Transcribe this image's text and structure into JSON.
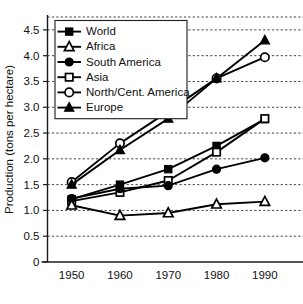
{
  "chart_data": {
    "type": "line",
    "title": "",
    "subtitle": "",
    "xlabel": "",
    "ylabel": "Production (tons per hectare)",
    "x": [
      1950,
      1960,
      1970,
      1980,
      1990
    ],
    "categories": [
      "1950",
      "1960",
      "1970",
      "1980",
      "1990"
    ],
    "xtick_labels": [
      "1950",
      "1960",
      "1970",
      "1980",
      "1990"
    ],
    "ytick_labels": [
      "0",
      "0.5",
      "1.0",
      "1.5",
      "2.0",
      "2.5",
      "3.0",
      "3.5",
      "4.0",
      "4.5"
    ],
    "ytick_values": [
      0,
      0.5,
      1.0,
      1.5,
      2.0,
      2.5,
      3.0,
      3.5,
      4.0,
      4.5
    ],
    "xlim": [
      1945,
      1995
    ],
    "ylim": [
      0,
      4.75
    ],
    "grid": "horizontal-dotted",
    "legend_position": "top-left",
    "series": [
      {
        "name": "World",
        "marker": "filled-square",
        "values": [
          1.22,
          1.5,
          1.8,
          2.25,
          2.77
        ]
      },
      {
        "name": "Africa",
        "marker": "open-triangle",
        "values": [
          1.1,
          0.9,
          0.95,
          1.12,
          1.17
        ]
      },
      {
        "name": "South America",
        "marker": "filled-circle",
        "values": [
          1.23,
          1.42,
          1.48,
          1.8,
          2.02
        ]
      },
      {
        "name": "Asia",
        "marker": "open-square",
        "values": [
          1.18,
          1.35,
          1.58,
          2.13,
          2.78
        ]
      },
      {
        "name": "North/Cent. America",
        "marker": "open-circle",
        "values": [
          1.55,
          2.3,
          2.92,
          3.56,
          3.97
        ]
      },
      {
        "name": "Europe",
        "marker": "filled-triangle",
        "values": [
          1.5,
          2.17,
          2.78,
          3.56,
          4.3
        ]
      }
    ]
  },
  "legend": {
    "entries": [
      "World",
      "Africa",
      "South America",
      "Asia",
      "North/Cent. America",
      "Europe"
    ]
  },
  "colors": {
    "ink": "#000000",
    "background": "#ffffff",
    "grid": "#2b2b2b"
  }
}
